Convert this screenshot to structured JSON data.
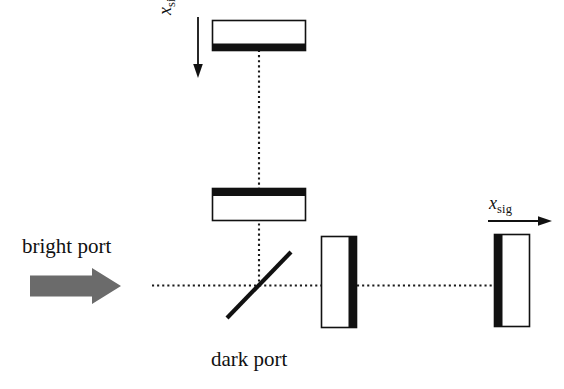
{
  "figure": {
    "type": "optics-schematic",
    "name": "michelson-interferometer-with-signal-recycling",
    "background_color": "#ffffff",
    "ink_color": "#111111",
    "beam_color": "#222222",
    "input_arrow_color": "#6b6b6b"
  },
  "labels": {
    "bright_port": "bright port",
    "dark_port": "dark port",
    "xsig_variable": "x",
    "xsig_subscript": "sig"
  },
  "components": [
    {
      "id": "mirror-top",
      "name": "top-end-mirror",
      "orientation": "horizontal",
      "coating_edge": "bottom",
      "x": 212,
      "y": 20,
      "width": 94,
      "height": 31
    },
    {
      "id": "mirror-middle",
      "name": "middle-end-mirror",
      "orientation": "horizontal",
      "coating_edge": "top",
      "x": 212,
      "y": 188,
      "width": 94,
      "height": 33
    },
    {
      "id": "beamsplitter",
      "name": "beam-splitter",
      "orientation": "diagonal-45",
      "x1": 227,
      "y1": 318,
      "x2": 291,
      "y2": 252
    },
    {
      "id": "mirror-inner-right",
      "name": "inner-right-mirror",
      "orientation": "vertical",
      "coating_edge": "right",
      "x": 321,
      "y": 236,
      "width": 36,
      "height": 92
    },
    {
      "id": "mirror-far-right",
      "name": "far-right-mirror",
      "orientation": "vertical",
      "coating_edge": "left",
      "x": 494,
      "y": 234,
      "width": 36,
      "height": 93
    }
  ],
  "beams": [
    {
      "id": "beam-horizontal-left",
      "from_x": 152,
      "to_x": 321,
      "y": 285
    },
    {
      "id": "beam-horizontal-right",
      "from_x": 357,
      "to_x": 496,
      "y": 285
    },
    {
      "id": "beam-vertical",
      "x": 259,
      "from_y": 51,
      "to_y": 285
    }
  ],
  "arrows": [
    {
      "id": "input-arrow",
      "direction": "right",
      "style": "block",
      "color": "#6b6b6b"
    },
    {
      "id": "xsig-top-arrow",
      "direction": "down",
      "style": "line"
    },
    {
      "id": "xsig-right-arrow",
      "direction": "right",
      "style": "line"
    }
  ]
}
